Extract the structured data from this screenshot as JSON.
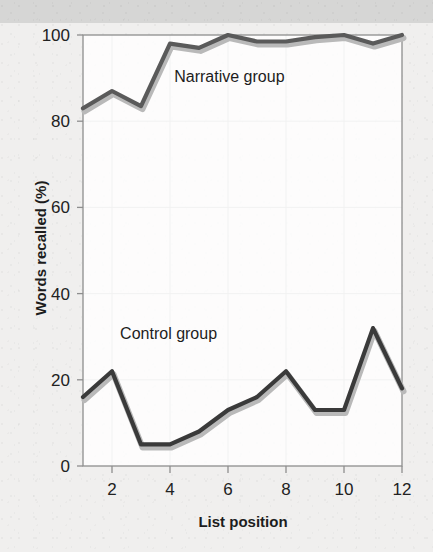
{
  "figure": {
    "background_color": "#f0efee",
    "header_band_color": "#d6d6d5",
    "frame_color": "#8e8e8e",
    "grid_color": "#b4b4b4"
  },
  "chart_data": {
    "type": "line",
    "title": "",
    "xlabel": "List position",
    "ylabel": "Words recalled (%)",
    "xlim": [
      1,
      12
    ],
    "ylim": [
      0,
      100
    ],
    "grid": true,
    "legend_position": "inline-annotation",
    "x": [
      1,
      2,
      3,
      4,
      5,
      6,
      7,
      8,
      9,
      10,
      11,
      12
    ],
    "xticks": [
      2,
      4,
      6,
      8,
      10,
      12
    ],
    "xtick_labels": [
      "2",
      "4",
      "6",
      "8",
      "10",
      "12"
    ],
    "yticks": [
      0,
      20,
      40,
      60,
      80,
      100
    ],
    "ytick_labels": [
      "0",
      "20",
      "40",
      "60",
      "80",
      "100"
    ],
    "series": [
      {
        "name": "Narrative group",
        "color": "#5a5a5a",
        "shadow_color": "#b9b9b9",
        "values": [
          83,
          87,
          83.5,
          98,
          97,
          100,
          98.5,
          98.5,
          99.5,
          100,
          98,
          100
        ]
      },
      {
        "name": "Control group",
        "color": "#3a3a3a",
        "shadow_color": "#b9b9b9",
        "values": [
          16,
          22,
          5,
          5,
          8,
          13,
          16,
          22,
          13,
          13,
          32,
          18
        ]
      }
    ],
    "annotations": [
      {
        "text": "Narrative group",
        "x": 6.05,
        "y": 89
      },
      {
        "text": "Control group",
        "x": 3.95,
        "y": 29.5
      }
    ]
  }
}
